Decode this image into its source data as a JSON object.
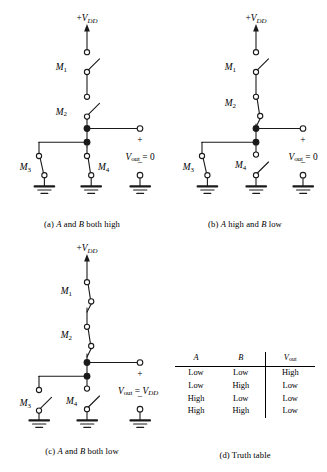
{
  "figure": {
    "supply_label": "+V",
    "supply_sub": "DD",
    "ground_name": "ground-symbol",
    "node_name": "junction-node"
  },
  "panels": [
    {
      "id": "a",
      "caption_prefix": "(a)",
      "caption_text_1": "A",
      "caption_mid": " and ",
      "caption_text_2": "B",
      "caption_suffix": " both high",
      "caption_plain": "(a) A and B both high",
      "supply": "+VDD",
      "vout_label": "V",
      "vout_sub": "out",
      "vout_eq": " = 0",
      "plus_sign": "+",
      "minus_sign": "−",
      "switches": [
        {
          "name": "M1",
          "label": "M",
          "sub": "1",
          "state": "open"
        },
        {
          "name": "M2",
          "label": "M",
          "sub": "2",
          "state": "open"
        },
        {
          "name": "M3",
          "label": "M",
          "sub": "3",
          "state": "closed"
        },
        {
          "name": "M4",
          "label": "M",
          "sub": "4",
          "state": "closed"
        }
      ]
    },
    {
      "id": "b",
      "caption_prefix": "(b)",
      "caption_text_1": "A",
      "caption_mid": " high and ",
      "caption_text_2": "B",
      "caption_suffix": " low",
      "caption_plain": "(b) A high and B low",
      "supply": "+VDD",
      "vout_label": "V",
      "vout_sub": "out",
      "vout_eq": " = 0",
      "plus_sign": "+",
      "minus_sign": "−",
      "switches": [
        {
          "name": "M1",
          "label": "M",
          "sub": "1",
          "state": "open"
        },
        {
          "name": "M2",
          "label": "M",
          "sub": "2",
          "state": "closed"
        },
        {
          "name": "M3",
          "label": "M",
          "sub": "3",
          "state": "closed"
        },
        {
          "name": "M4",
          "label": "M",
          "sub": "4",
          "state": "open"
        }
      ]
    },
    {
      "id": "c",
      "caption_prefix": "(c)",
      "caption_text_1": "A",
      "caption_mid": " and ",
      "caption_text_2": "B",
      "caption_suffix": " both low",
      "caption_plain": "(c) A and B both low",
      "supply": "+VDD",
      "vout_label": "V",
      "vout_sub": "out",
      "vout_eq": " = V",
      "vout_eq_sub": "DD",
      "plus_sign": "+",
      "minus_sign": "−",
      "switches": [
        {
          "name": "M1",
          "label": "M",
          "sub": "1",
          "state": "closed"
        },
        {
          "name": "M2",
          "label": "M",
          "sub": "2",
          "state": "closed"
        },
        {
          "name": "M3",
          "label": "M",
          "sub": "3",
          "state": "open"
        },
        {
          "name": "M4",
          "label": "M",
          "sub": "4",
          "state": "open"
        }
      ]
    },
    {
      "id": "d",
      "caption_prefix": "(d)",
      "caption_suffix": "Truth table",
      "caption_plain": "(d) Truth table"
    }
  ],
  "truth_table": {
    "headers": [
      "A",
      "B",
      "Vout"
    ],
    "header_parts": [
      {
        "text": "A",
        "sub": ""
      },
      {
        "text": "B",
        "sub": ""
      },
      {
        "text": "V",
        "sub": "out"
      }
    ],
    "rows": [
      [
        "Low",
        "Low",
        "High"
      ],
      [
        "Low",
        "High",
        "Low"
      ],
      [
        "High",
        "Low",
        "Low"
      ],
      [
        "High",
        "High",
        "Low"
      ]
    ]
  },
  "colors": {
    "line": "#1a1a1a",
    "background": "#ffffff",
    "text": "#000000"
  }
}
